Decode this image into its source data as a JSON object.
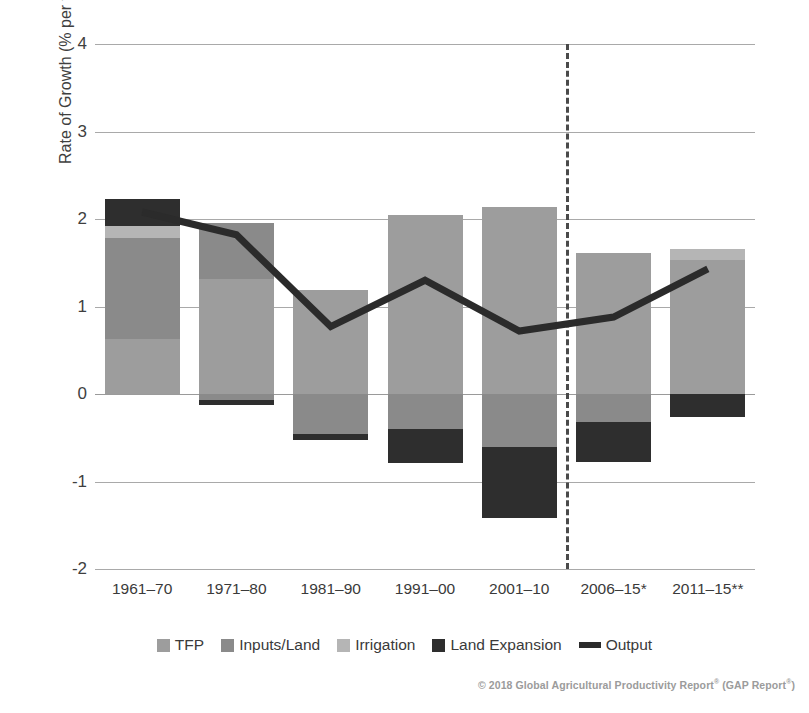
{
  "chart_data": {
    "type": "bar",
    "subtype": "stacked-bar-with-line",
    "title": "",
    "xlabel": "",
    "ylabel": "Rate of Growth (% per year)",
    "ylim": [
      -2,
      4
    ],
    "yticks": [
      4,
      3,
      2,
      1,
      0,
      -1,
      -2
    ],
    "ytick_labels": [
      "4",
      "3",
      "2",
      "1",
      "0",
      "-1",
      "-2"
    ],
    "grid": true,
    "legend_position": "bottom",
    "categories": [
      "1961–70",
      "1971–80",
      "1981–90",
      "1991–00",
      "2001–10",
      "2006–15*",
      "2011–15**"
    ],
    "series": [
      {
        "name": "TFP",
        "color": "#9d9d9d",
        "values": [
          0.63,
          1.32,
          1.19,
          2.05,
          2.14,
          1.61,
          1.53
        ]
      },
      {
        "name": "Inputs/Land",
        "color": "#8a8a8a",
        "values": [
          1.15,
          0.63,
          0.0,
          0.0,
          0.0,
          0.0,
          0.0
        ]
      },
      {
        "name": "Irrigation",
        "color": "#b5b5b5",
        "values": [
          0.14,
          0.0,
          0.0,
          0.0,
          0.0,
          0.0,
          0.13
        ]
      },
      {
        "name": "Land Expansion",
        "color": "#2e2e2e",
        "values": [
          0.31,
          0.0,
          0.0,
          0.0,
          0.0,
          0.0,
          0.0
        ]
      }
    ],
    "negative_segments": [
      {
        "name": "Inputs/Land",
        "color": "#8a8a8a",
        "values": [
          0.0,
          -0.07,
          -0.46,
          -0.4,
          -0.6,
          -0.32,
          0.0
        ]
      },
      {
        "name": "Land Expansion",
        "color": "#2e2e2e",
        "values": [
          0.0,
          -0.05,
          -0.06,
          -0.39,
          -0.82,
          -0.46,
          -0.26
        ]
      }
    ],
    "line_series": {
      "name": "Output",
      "color": "#2b2b2b",
      "values": [
        2.08,
        1.82,
        0.77,
        1.3,
        0.72,
        0.88,
        1.43
      ]
    },
    "annotations": [
      {
        "type": "vertical-dashed-line",
        "between": [
          "2001–10",
          "2006–15*"
        ]
      }
    ]
  },
  "legend": {
    "items": [
      {
        "label": "TFP",
        "color": "#9d9d9d",
        "marker": "square"
      },
      {
        "label": "Inputs/Land",
        "color": "#8a8a8a",
        "marker": "square"
      },
      {
        "label": "Irrigation",
        "color": "#b5b5b5",
        "marker": "square"
      },
      {
        "label": "Land Expansion",
        "color": "#2e2e2e",
        "marker": "square"
      },
      {
        "label": "Output",
        "color": "#2b2b2b",
        "marker": "line"
      }
    ]
  },
  "footer": {
    "text": "© 2018 Global Agricultural Productivity Report",
    "sup1": "®",
    "text2": " (GAP Report",
    "sup2": "®",
    "text3": ")"
  }
}
